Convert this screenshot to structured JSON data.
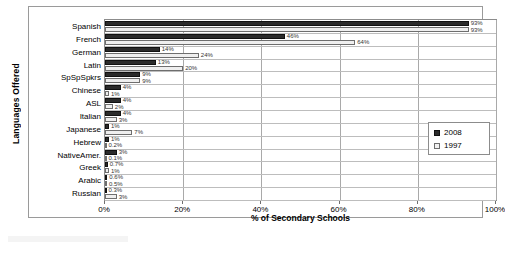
{
  "chart_data": {
    "type": "bar",
    "orientation": "horizontal",
    "title": "",
    "xlabel": "% of Secondary Schools",
    "ylabel": "Languages Offered",
    "xlim": [
      0,
      100
    ],
    "xticks": [
      "0%",
      "20%",
      "40%",
      "60%",
      "80%",
      "100%"
    ],
    "xtick_values": [
      0,
      20,
      40,
      60,
      80,
      100
    ],
    "grid": true,
    "legend_position": "right-middle",
    "categories": [
      "Spanish",
      "French",
      "German",
      "Latin",
      "SpSpSpkrs",
      "Chinese",
      "ASL",
      "Italian",
      "Japanese",
      "Hebrew",
      "NativeAmer.",
      "Greek",
      "Arabic",
      "Russian"
    ],
    "series": [
      {
        "name": "2008",
        "color": "#2b2b2b",
        "values": [
          93,
          46,
          14,
          13,
          9,
          4,
          4,
          4,
          1,
          1,
          3,
          0.7,
          0.6,
          0.3
        ],
        "labels": [
          "93%",
          "46%",
          "14%",
          "13%",
          "9%",
          "4%",
          "4%",
          "4%",
          "1%",
          "1%",
          "3%",
          "0.7%",
          "0.6%",
          "0.3%"
        ]
      },
      {
        "name": "1997",
        "color": "#efefef",
        "values": [
          93,
          64,
          24,
          20,
          9,
          1,
          2,
          3,
          7,
          0.2,
          0.1,
          1,
          0.5,
          3
        ],
        "labels": [
          "93%",
          "64%",
          "24%",
          "20%",
          "9%",
          "1%",
          "2%",
          "3%",
          "7%",
          "0.2%",
          "0.1%",
          "1%",
          "0.5%",
          "3%"
        ]
      }
    ]
  },
  "legend": {
    "entries": [
      {
        "label": "2008"
      },
      {
        "label": "1997"
      }
    ]
  }
}
